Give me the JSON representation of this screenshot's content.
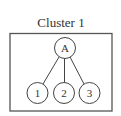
{
  "diagram": {
    "title": "Cluster 1",
    "root": {
      "id": "A",
      "label": "A",
      "cx": 65,
      "cy": 48,
      "r": 10.5
    },
    "children": [
      {
        "id": "1",
        "label": "1",
        "cx": 37.5,
        "cy": 93,
        "r": 10.5
      },
      {
        "id": "2",
        "label": "2",
        "cx": 64,
        "cy": 93,
        "r": 10.5
      },
      {
        "id": "3",
        "label": "3",
        "cx": 89.5,
        "cy": 93,
        "r": 10.5
      }
    ],
    "edges": [
      {
        "from": "A",
        "to": "1"
      },
      {
        "from": "A",
        "to": "2"
      },
      {
        "from": "A",
        "to": "3"
      }
    ],
    "colors": {
      "stroke": "#444444",
      "text": "#333333",
      "background": "#ffffff"
    }
  }
}
